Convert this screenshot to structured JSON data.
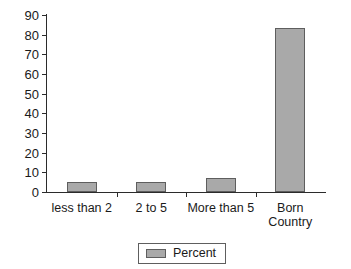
{
  "chart_data": {
    "type": "bar",
    "title": "",
    "subtitle": "",
    "xlabel": "",
    "ylabel": "",
    "categories": [
      "less than 2",
      "2 to 5",
      "More than 5",
      "Born\nCountry"
    ],
    "series": [
      {
        "name": "Percent",
        "values": [
          5,
          5,
          7,
          83.5
        ],
        "color": "#a9a9a9"
      }
    ],
    "ylim": [
      0,
      90
    ],
    "yticks": [
      0,
      10,
      20,
      30,
      40,
      50,
      60,
      70,
      80,
      90
    ],
    "ytick_labels": [
      "0",
      "10",
      "20",
      "30",
      "40",
      "50",
      "60",
      "70",
      "80",
      "90"
    ],
    "grid": false,
    "legend": {
      "position": "bottom",
      "entries": [
        {
          "label": "Percent",
          "color": "#a9a9a9"
        }
      ]
    },
    "axis_color": "#2b2b2b",
    "bar_edge_color": "#5e5e5e",
    "background": "#ffffff"
  }
}
